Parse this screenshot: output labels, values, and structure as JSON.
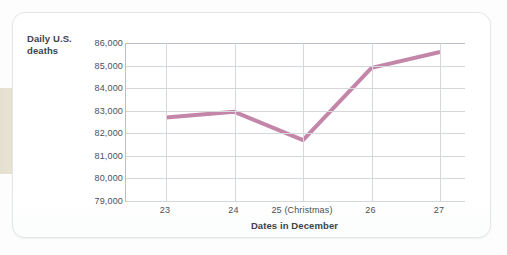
{
  "figure": {
    "y_axis_title_line1": "Daily U.S.",
    "y_axis_title_line2": "deaths",
    "x_axis_title": "Dates in December",
    "line_color": "#c386a8",
    "grid_color": "#d4d8db",
    "axis_color": "#b9bfc4",
    "card_background": "#ffffff",
    "page_background": "#fdfdfd"
  },
  "chart_data": {
    "type": "line",
    "title": "",
    "subtitle": "",
    "xlabel": "Dates in December",
    "ylabel": "Daily U.S. deaths",
    "categories": [
      "23",
      "24",
      "25 (Christmas)",
      "26",
      "27"
    ],
    "values": [
      82700,
      82950,
      81700,
      84900,
      85600
    ],
    "series": [
      {
        "name": "Daily U.S. deaths",
        "values": [
          82700,
          82950,
          81700,
          84900,
          85600
        ],
        "color": "#c386a8"
      }
    ],
    "ylim": [
      79000,
      86000
    ],
    "ytick_labels": [
      "79,000",
      "80,000",
      "81,000",
      "82,000",
      "83,000",
      "84,000",
      "85,000",
      "86,000"
    ],
    "ytick_values": [
      79000,
      80000,
      81000,
      82000,
      83000,
      84000,
      85000,
      86000
    ],
    "xtick_labels": [
      "23",
      "24",
      "25 (Christmas)",
      "26",
      "27"
    ],
    "grid": "both",
    "legend": "none"
  }
}
